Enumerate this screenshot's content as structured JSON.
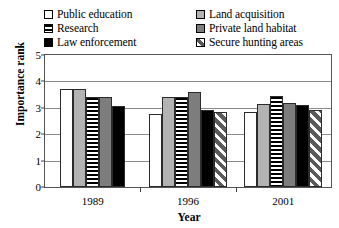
{
  "chart_data": {
    "type": "bar",
    "title": "",
    "xlabel": "Year",
    "ylabel": "Importance rank",
    "categories": [
      "1989",
      "1996",
      "2001"
    ],
    "ylim": [
      0,
      5
    ],
    "yticks": [
      "0",
      "1",
      "2",
      "3",
      "4",
      "5"
    ],
    "grid": true,
    "legend_position": "top",
    "series": [
      {
        "name": "Public education",
        "swatch": "white",
        "color": "#ffffff",
        "values": [
          3.7,
          2.75,
          2.85
        ]
      },
      {
        "name": "Land acquisition",
        "swatch": "light-gray",
        "color": "#b3b3b3",
        "values": [
          3.7,
          3.4,
          3.15
        ]
      },
      {
        "name": "Research",
        "swatch": "horizontal-stripes",
        "color": "#000000",
        "values": [
          3.4,
          3.4,
          3.45
        ]
      },
      {
        "name": "Private land habitat",
        "swatch": "dark-gray",
        "color": "#7d7d7d",
        "values": [
          3.4,
          3.6,
          3.2
        ]
      },
      {
        "name": "Law enforcement",
        "swatch": "black",
        "color": "#000000",
        "values": [
          3.05,
          2.9,
          3.1
        ]
      },
      {
        "name": "Secure hunting areas",
        "swatch": "diagonal-hatch",
        "color": "#5a5a5a",
        "values": [
          null,
          2.85,
          2.9
        ]
      }
    ]
  },
  "legend": {
    "items": [
      {
        "label": "Public education",
        "swatch": "white"
      },
      {
        "label": "Land acquisition",
        "swatch": "light-gray"
      },
      {
        "label": "Research",
        "swatch": "horizontal-stripes"
      },
      {
        "label": "Private land habitat",
        "swatch": "dark-gray"
      },
      {
        "label": "Law enforcement",
        "swatch": "black"
      },
      {
        "label": "Secure hunting areas",
        "swatch": "diagonal-hatch"
      }
    ]
  },
  "axes": {
    "y_title": "Importance rank",
    "x_title": "Year",
    "y_ticks": [
      "5",
      "4",
      "3",
      "2",
      "1",
      "0"
    ],
    "x_ticks": [
      "1989",
      "1996",
      "2001"
    ]
  }
}
